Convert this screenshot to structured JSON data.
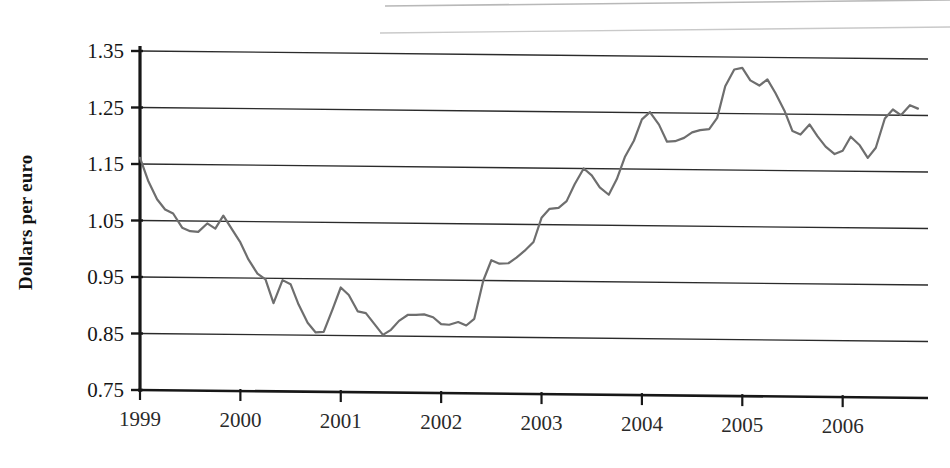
{
  "chart_data": {
    "type": "line",
    "title": "",
    "subtitle": "",
    "xlabel": "",
    "ylabel": "Dollars per euro",
    "ylim": [
      0.75,
      1.35
    ],
    "xlim": [
      1999.0,
      2006.85
    ],
    "grid": true,
    "legend": null,
    "line_color": "#6e6e6e",
    "axis_color": "#1a1a1a",
    "yticks": [
      "1.35",
      "1.25",
      "1.15",
      "1.05",
      "0.95",
      "0.85",
      "0.75"
    ],
    "ytick_values": [
      1.35,
      1.25,
      1.15,
      1.05,
      0.95,
      0.85,
      0.75
    ],
    "xticks": [
      "1999",
      "2000",
      "2001",
      "2002",
      "2003",
      "2004",
      "2005",
      "2006"
    ],
    "xtick_values": [
      1999,
      2000,
      2001,
      2002,
      2003,
      2004,
      2005,
      2006
    ],
    "series": [
      {
        "name": "Dollars per euro",
        "x": [
          1999.0,
          1999.08,
          1999.17,
          1999.25,
          1999.33,
          1999.42,
          1999.5,
          1999.58,
          1999.67,
          1999.75,
          1999.83,
          1999.92,
          2000.0,
          2000.08,
          2000.17,
          2000.25,
          2000.33,
          2000.42,
          2000.5,
          2000.58,
          2000.67,
          2000.75,
          2000.83,
          2000.92,
          2001.0,
          2001.08,
          2001.17,
          2001.25,
          2001.33,
          2001.42,
          2001.5,
          2001.58,
          2001.67,
          2001.75,
          2001.83,
          2001.92,
          2002.0,
          2002.08,
          2002.17,
          2002.25,
          2002.33,
          2002.42,
          2002.5,
          2002.58,
          2002.67,
          2002.75,
          2002.83,
          2002.92,
          2003.0,
          2003.08,
          2003.17,
          2003.25,
          2003.33,
          2003.42,
          2003.5,
          2003.58,
          2003.67,
          2003.75,
          2003.83,
          2003.92,
          2004.0,
          2004.08,
          2004.17,
          2004.25,
          2004.33,
          2004.42,
          2004.5,
          2004.58,
          2004.67,
          2004.75,
          2004.83,
          2004.92,
          2005.0,
          2005.08,
          2005.17,
          2005.25,
          2005.33,
          2005.42,
          2005.5,
          2005.58,
          2005.67,
          2005.75,
          2005.83,
          2005.92,
          2006.0,
          2006.08,
          2006.17,
          2006.25,
          2006.33,
          2006.42,
          2006.5,
          2006.58,
          2006.67,
          2006.75
        ],
        "y": [
          1.161,
          1.121,
          1.088,
          1.07,
          1.063,
          1.038,
          1.032,
          1.031,
          1.046,
          1.037,
          1.06,
          1.035,
          1.013,
          0.983,
          0.958,
          0.948,
          0.906,
          0.947,
          0.94,
          0.904,
          0.872,
          0.855,
          0.856,
          0.897,
          0.935,
          0.922,
          0.893,
          0.89,
          0.872,
          0.852,
          0.861,
          0.877,
          0.888,
          0.888,
          0.889,
          0.884,
          0.872,
          0.871,
          0.876,
          0.87,
          0.882,
          0.95,
          0.986,
          0.98,
          0.981,
          0.991,
          1.003,
          1.019,
          1.062,
          1.078,
          1.08,
          1.092,
          1.122,
          1.15,
          1.138,
          1.117,
          1.104,
          1.132,
          1.171,
          1.2,
          1.238,
          1.251,
          1.229,
          1.199,
          1.2,
          1.206,
          1.216,
          1.22,
          1.222,
          1.242,
          1.298,
          1.328,
          1.331,
          1.309,
          1.3,
          1.311,
          1.287,
          1.256,
          1.22,
          1.214,
          1.232,
          1.211,
          1.193,
          1.18,
          1.186,
          1.211,
          1.196,
          1.174,
          1.192,
          1.244,
          1.26,
          1.25,
          1.268,
          1.262
        ]
      }
    ]
  },
  "axis_label": {
    "ylabel": "Dollars per euro"
  }
}
